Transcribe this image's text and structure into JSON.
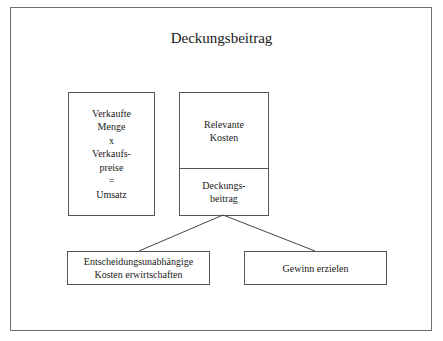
{
  "diagram": {
    "title": "Deckungsbeitrag",
    "left_box": {
      "lines": [
        "Verkaufte",
        "Menge",
        "x",
        "Verkaufs-",
        "preise",
        "=",
        "Umsatz"
      ]
    },
    "middle_box": {
      "top_lines": [
        "Relevante",
        "Kosten"
      ],
      "bottom_lines": [
        "Deckungs-",
        "beitrag"
      ]
    },
    "bottom_left_box": {
      "lines": [
        "Entscheidungsunabhängige",
        "Kosten erwirtschaften"
      ]
    },
    "bottom_right_box": {
      "lines": [
        "Gewinn erzielen"
      ]
    },
    "edges": [
      {
        "from": "Deckungsbeitrag",
        "to": "Entscheidungsunabhängige Kosten erwirtschaften"
      },
      {
        "from": "Deckungsbeitrag",
        "to": "Gewinn erzielen"
      }
    ]
  }
}
